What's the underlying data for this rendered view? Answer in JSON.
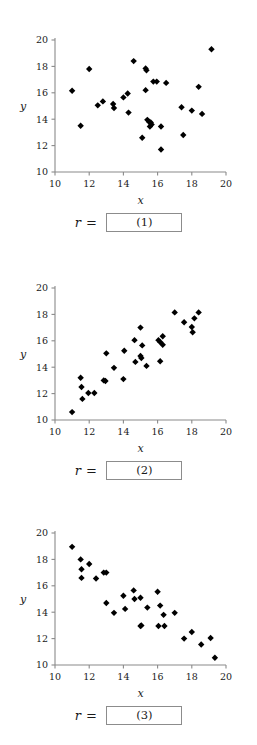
{
  "page": {
    "background_color": "#ffffff"
  },
  "answers": [
    {
      "symbol": "r =",
      "box_label": "(1)"
    },
    {
      "symbol": "r =",
      "box_label": "(2)"
    },
    {
      "symbol": "r =",
      "box_label": "(3)"
    }
  ],
  "chart_data": [
    {
      "type": "scatter",
      "title": "",
      "xlabel": "x",
      "ylabel": "y",
      "xlim": [
        10,
        20
      ],
      "ylim": [
        10,
        20
      ],
      "xticks": [
        10,
        12,
        14,
        16,
        18,
        20
      ],
      "yticks": [
        10,
        12,
        14,
        16,
        18,
        20
      ],
      "grid": false,
      "legend": "none",
      "marker": "diamond",
      "marker_color": "#000000",
      "annotation": "(1)",
      "points": [
        [
          11.0,
          16.15
        ],
        [
          11.5,
          13.5
        ],
        [
          12.0,
          17.8
        ],
        [
          12.5,
          15.05
        ],
        [
          12.8,
          15.35
        ],
        [
          13.4,
          15.15
        ],
        [
          13.45,
          14.85
        ],
        [
          14.0,
          15.65
        ],
        [
          14.25,
          15.95
        ],
        [
          14.3,
          14.5
        ],
        [
          14.6,
          18.4
        ],
        [
          15.1,
          12.6
        ],
        [
          15.3,
          17.85
        ],
        [
          15.35,
          17.7
        ],
        [
          15.3,
          16.2
        ],
        [
          15.4,
          13.95
        ],
        [
          15.5,
          13.8
        ],
        [
          15.6,
          13.75
        ],
        [
          15.65,
          13.6
        ],
        [
          15.55,
          13.45
        ],
        [
          15.75,
          16.85
        ],
        [
          15.95,
          16.85
        ],
        [
          16.2,
          13.45
        ],
        [
          16.2,
          11.7
        ],
        [
          16.5,
          16.75
        ],
        [
          17.4,
          14.9
        ],
        [
          17.5,
          12.8
        ],
        [
          18.0,
          14.65
        ],
        [
          18.4,
          16.45
        ],
        [
          18.6,
          14.4
        ],
        [
          19.15,
          19.3
        ]
      ]
    },
    {
      "type": "scatter",
      "title": "",
      "xlabel": "x",
      "ylabel": "y",
      "xlim": [
        10,
        20
      ],
      "ylim": [
        10,
        20
      ],
      "xticks": [
        10,
        12,
        14,
        16,
        18,
        20
      ],
      "yticks": [
        10,
        12,
        14,
        16,
        18,
        20
      ],
      "grid": false,
      "legend": "none",
      "marker": "diamond",
      "marker_color": "#000000",
      "annotation": "(2)",
      "points": [
        [
          11.0,
          10.6
        ],
        [
          11.5,
          13.2
        ],
        [
          11.55,
          12.5
        ],
        [
          11.6,
          11.6
        ],
        [
          11.95,
          12.05
        ],
        [
          12.3,
          12.05
        ],
        [
          12.85,
          13.0
        ],
        [
          12.95,
          12.95
        ],
        [
          13.0,
          15.05
        ],
        [
          13.45,
          13.95
        ],
        [
          14.0,
          13.1
        ],
        [
          14.05,
          15.25
        ],
        [
          14.65,
          16.05
        ],
        [
          14.7,
          14.4
        ],
        [
          15.0,
          17.0
        ],
        [
          15.0,
          14.85
        ],
        [
          15.05,
          14.7
        ],
        [
          15.1,
          15.65
        ],
        [
          15.35,
          14.1
        ],
        [
          16.05,
          16.05
        ],
        [
          16.15,
          15.9
        ],
        [
          16.15,
          14.45
        ],
        [
          16.3,
          16.35
        ],
        [
          16.3,
          15.7
        ],
        [
          17.0,
          18.15
        ],
        [
          17.55,
          17.4
        ],
        [
          18.0,
          17.05
        ],
        [
          18.05,
          16.65
        ],
        [
          18.15,
          17.7
        ],
        [
          18.4,
          18.15
        ]
      ]
    },
    {
      "type": "scatter",
      "title": "",
      "xlabel": "x",
      "ylabel": "y",
      "xlim": [
        10,
        20
      ],
      "ylim": [
        10,
        20
      ],
      "xticks": [
        10,
        12,
        14,
        16,
        18,
        20
      ],
      "yticks": [
        10,
        12,
        14,
        16,
        18,
        20
      ],
      "grid": false,
      "legend": "none",
      "marker": "diamond",
      "marker_color": "#000000",
      "annotation": "(3)",
      "points": [
        [
          11.0,
          18.95
        ],
        [
          11.5,
          18.0
        ],
        [
          11.55,
          17.25
        ],
        [
          11.55,
          16.6
        ],
        [
          12.0,
          17.65
        ],
        [
          12.4,
          16.55
        ],
        [
          12.85,
          17.0
        ],
        [
          13.0,
          17.0
        ],
        [
          13.0,
          14.7
        ],
        [
          13.45,
          13.95
        ],
        [
          14.0,
          15.25
        ],
        [
          14.1,
          14.25
        ],
        [
          14.6,
          15.65
        ],
        [
          14.65,
          15.0
        ],
        [
          15.0,
          15.1
        ],
        [
          15.05,
          13.0
        ],
        [
          15.0,
          12.95
        ],
        [
          15.4,
          14.35
        ],
        [
          16.0,
          15.55
        ],
        [
          16.05,
          12.95
        ],
        [
          16.15,
          14.5
        ],
        [
          16.35,
          13.8
        ],
        [
          16.4,
          12.95
        ],
        [
          17.0,
          13.95
        ],
        [
          17.55,
          12.0
        ],
        [
          18.0,
          12.5
        ],
        [
          18.55,
          11.55
        ],
        [
          19.1,
          12.05
        ],
        [
          19.35,
          10.55
        ]
      ]
    }
  ]
}
